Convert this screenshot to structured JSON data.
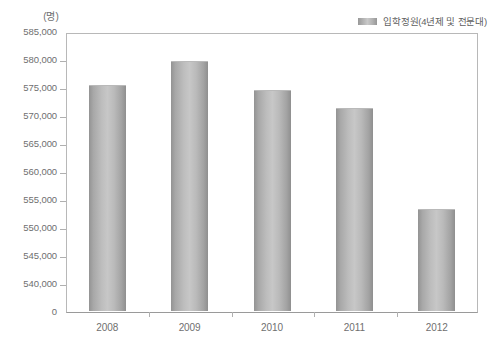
{
  "chart_data": {
    "type": "bar",
    "title": "",
    "subtitle": "",
    "xlabel": "",
    "ylabel": "(명)",
    "unit_label": "(명)",
    "categories": [
      "2008",
      "2009",
      "2010",
      "2011",
      "2012"
    ],
    "series": [
      {
        "name": "입학정원(4년제 및 전문대)",
        "values": [
          575400,
          579700,
          574500,
          571200,
          553200
        ]
      }
    ],
    "ylim": [
      540000,
      585000
    ],
    "y_axis_broken": true,
    "y_ticks": [
      "585,000",
      "580,000",
      "575,000",
      "570,000",
      "565,000",
      "560,000",
      "555,000",
      "550,000",
      "545,000",
      "540,000",
      "0"
    ],
    "y_tick_values": [
      585000,
      580000,
      575000,
      570000,
      565000,
      560000,
      555000,
      550000,
      545000,
      540000,
      0
    ],
    "grid": false,
    "legend_position": "top-right",
    "colors": {
      "bar_light": "#c7c7c7",
      "bar_dark": "#8f8f8f",
      "axis": "#b0b0b0",
      "text": "#6f6f6f"
    }
  },
  "legend": {
    "entries": [
      {
        "label": "입학정원(4년제 및 전문대)",
        "swatch": "legend-swatch-icon"
      }
    ]
  }
}
